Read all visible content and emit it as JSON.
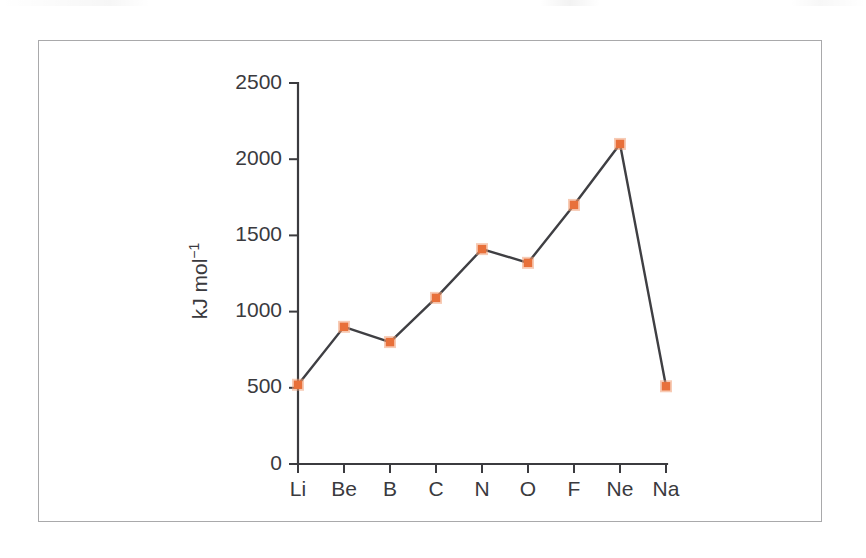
{
  "figure": {
    "border_color": "#a9a9ab",
    "background": "#ffffff"
  },
  "chart_data": {
    "type": "line",
    "title": "",
    "subtitle": "",
    "xlabel": "",
    "ylabel": "kJ mol",
    "ylabel_superscript": "−1",
    "categories": [
      "Li",
      "Be",
      "B",
      "C",
      "N",
      "O",
      "F",
      "Ne",
      "Na"
    ],
    "values": [
      520,
      900,
      800,
      1090,
      1410,
      1320,
      1700,
      2100,
      510
    ],
    "series": [
      {
        "name": "First ionization energy",
        "values": [
          520,
          900,
          800,
          1090,
          1410,
          1320,
          1700,
          2100,
          510
        ],
        "line_color": "#3f3f43",
        "marker_color": "#e8703a",
        "marker_shape": "square"
      }
    ],
    "ylim": [
      0,
      2500
    ],
    "yticks": [
      0,
      500,
      1000,
      1500,
      2000,
      2500
    ],
    "ytick_labels": [
      "0",
      "500",
      "1000",
      "1500",
      "2000",
      "2500"
    ],
    "xtick_labels": [
      "Li",
      "Be",
      "B",
      "C",
      "N",
      "O",
      "F",
      "Ne",
      "Na"
    ],
    "grid": false,
    "legend": false,
    "legend_position": "none"
  },
  "axis": {
    "y_title_text": "kJ mol",
    "y_title_sup": "−1",
    "y_ticks": [
      {
        "label": "2500",
        "value": 2500
      },
      {
        "label": "2000",
        "value": 2000
      },
      {
        "label": "1500",
        "value": 1500
      },
      {
        "label": "1000",
        "value": 1000
      },
      {
        "label": "500",
        "value": 500
      },
      {
        "label": "0",
        "value": 0
      }
    ],
    "x_ticks": [
      {
        "label": "Li",
        "value": 520
      },
      {
        "label": "Be",
        "value": 900
      },
      {
        "label": "B",
        "value": 800
      },
      {
        "label": "C",
        "value": 1090
      },
      {
        "label": "N",
        "value": 1410
      },
      {
        "label": "O",
        "value": 1320
      },
      {
        "label": "F",
        "value": 1700
      },
      {
        "label": "Ne",
        "value": 2100
      },
      {
        "label": "Na",
        "value": 510
      }
    ]
  }
}
